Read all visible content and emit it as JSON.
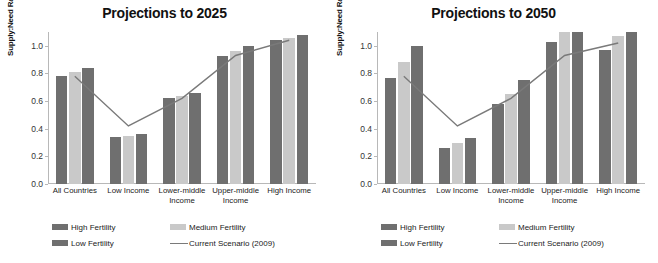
{
  "figure": {
    "y_axis_title": "Supply:Need Ratio",
    "colors": {
      "high_fertility": "#6f6f6f",
      "medium_fertility": "#c9c9c9",
      "low_fertility": "#6f6f6f",
      "current_scenario_line": "#7a7a7a",
      "axis": "#b8b8b8",
      "text": "#222222"
    }
  },
  "legend": {
    "items": [
      {
        "label": "High Fertility",
        "swatch": "bar-swatch-dark",
        "color": "#6f6f6f"
      },
      {
        "label": "Medium Fertility",
        "swatch": "bar-swatch-light",
        "color": "#c9c9c9"
      },
      {
        "label": "Low Fertility",
        "swatch": "bar-swatch-dark",
        "color": "#6f6f6f"
      },
      {
        "label": "Current Scenario (2009)",
        "swatch": "line-swatch",
        "color": "#7a7a7a"
      }
    ]
  },
  "chart_data": [
    {
      "type": "bar",
      "title": "Projections to 2025",
      "xlabel": "",
      "ylabel": "Supply:Need Ratio",
      "ylim": [
        0.0,
        1.1
      ],
      "yticks": [
        "0.0",
        "0.2",
        "0.4",
        "0.6",
        "0.8",
        "1.0"
      ],
      "ytick_values": [
        0.0,
        0.2,
        0.4,
        0.6,
        0.8,
        1.0
      ],
      "grid": false,
      "legend_position": "bottom",
      "categories": [
        "All Countries",
        "Low Income",
        "Lower-middle Income",
        "Upper-middle Income",
        "High Income"
      ],
      "series": [
        {
          "name": "High Fertility",
          "values": [
            0.78,
            0.34,
            0.62,
            0.93,
            1.04
          ]
        },
        {
          "name": "Medium Fertility",
          "values": [
            0.81,
            0.35,
            0.64,
            0.96,
            1.06
          ]
        },
        {
          "name": "Low Fertility",
          "values": [
            0.84,
            0.36,
            0.66,
            1.0,
            1.08
          ]
        }
      ],
      "line_series": {
        "name": "Current Scenario (2009)",
        "values": [
          0.78,
          0.42,
          0.62,
          0.93,
          1.04
        ]
      }
    },
    {
      "type": "bar",
      "title": "Projections to 2050",
      "xlabel": "",
      "ylabel": "Supply:Need Ratio",
      "ylim": [
        0.0,
        1.1
      ],
      "yticks": [
        "0.0",
        "0.2",
        "0.4",
        "0.6",
        "0.8",
        "1.0"
      ],
      "ytick_values": [
        0.0,
        0.2,
        0.4,
        0.6,
        0.8,
        1.0
      ],
      "grid": false,
      "legend_position": "bottom",
      "categories": [
        "All Countries",
        "Low Income",
        "Lower-middle Income",
        "Upper-middle Income",
        "High Income"
      ],
      "series": [
        {
          "name": "High Fertility",
          "values": [
            0.77,
            0.26,
            0.58,
            1.03,
            0.97
          ]
        },
        {
          "name": "Medium Fertility",
          "values": [
            0.88,
            0.3,
            0.65,
            1.1,
            1.07
          ]
        },
        {
          "name": "Low Fertility",
          "values": [
            1.0,
            0.33,
            0.75,
            1.1,
            1.1
          ]
        }
      ],
      "line_series": {
        "name": "Current Scenario (2009)",
        "values": [
          0.78,
          0.42,
          0.62,
          0.93,
          1.02
        ]
      }
    }
  ]
}
